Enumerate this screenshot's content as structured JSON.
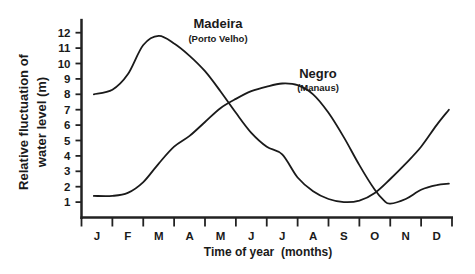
{
  "chart_data": {
    "type": "line",
    "title": "",
    "xlabel": "Time of year  (months)",
    "ylabel_line1": "Relative fluctuation of",
    "ylabel_line2": "water level (m)",
    "ylabel": "Relative fluctuation of water level (m)",
    "categories": [
      "J",
      "F",
      "M",
      "A",
      "M",
      "J",
      "J",
      "A",
      "S",
      "O",
      "N",
      "D"
    ],
    "yticks": [
      1,
      2,
      3,
      4,
      5,
      6,
      7,
      8,
      9,
      10,
      11,
      12
    ],
    "ylim": [
      0,
      12.5
    ],
    "xlim": [
      0,
      12
    ],
    "grid": false,
    "legend": "inline annotations",
    "series": [
      {
        "name": "Madeira",
        "sublabel": "(Porto Velho)",
        "x": [
          0.4,
          1.0,
          1.5,
          2.0,
          2.5,
          3.0,
          3.5,
          4.0,
          4.5,
          5.0,
          5.5,
          6.0,
          6.5,
          7.0,
          7.5,
          8.0,
          8.5,
          9.0,
          9.5,
          10.0,
          10.5,
          11.0,
          11.5,
          11.9
        ],
        "values": [
          8.0,
          8.3,
          9.3,
          11.2,
          11.8,
          11.3,
          10.5,
          9.5,
          8.2,
          6.8,
          5.5,
          4.6,
          4.1,
          2.6,
          1.7,
          1.2,
          1.0,
          1.1,
          1.6,
          2.5,
          3.5,
          4.6,
          6.0,
          7.0
        ]
      },
      {
        "name": "Negro",
        "sublabel": "(Manaus)",
        "x": [
          0.4,
          1.0,
          1.5,
          2.0,
          2.5,
          3.0,
          3.5,
          4.0,
          4.5,
          5.0,
          5.5,
          6.0,
          6.5,
          7.0,
          7.5,
          8.0,
          8.5,
          9.0,
          9.5,
          9.8,
          10.0,
          10.5,
          11.0,
          11.5,
          11.9
        ],
        "values": [
          1.4,
          1.4,
          1.6,
          2.3,
          3.5,
          4.6,
          5.3,
          6.2,
          7.1,
          7.7,
          8.2,
          8.5,
          8.7,
          8.6,
          8.0,
          6.8,
          5.2,
          3.4,
          1.8,
          1.1,
          0.9,
          1.2,
          1.8,
          2.1,
          2.2
        ]
      }
    ],
    "annotations": [
      {
        "text": "Madeira",
        "sub": "(Porto Velho)"
      },
      {
        "text": "Negro",
        "sub": "(Manaus)"
      }
    ]
  }
}
